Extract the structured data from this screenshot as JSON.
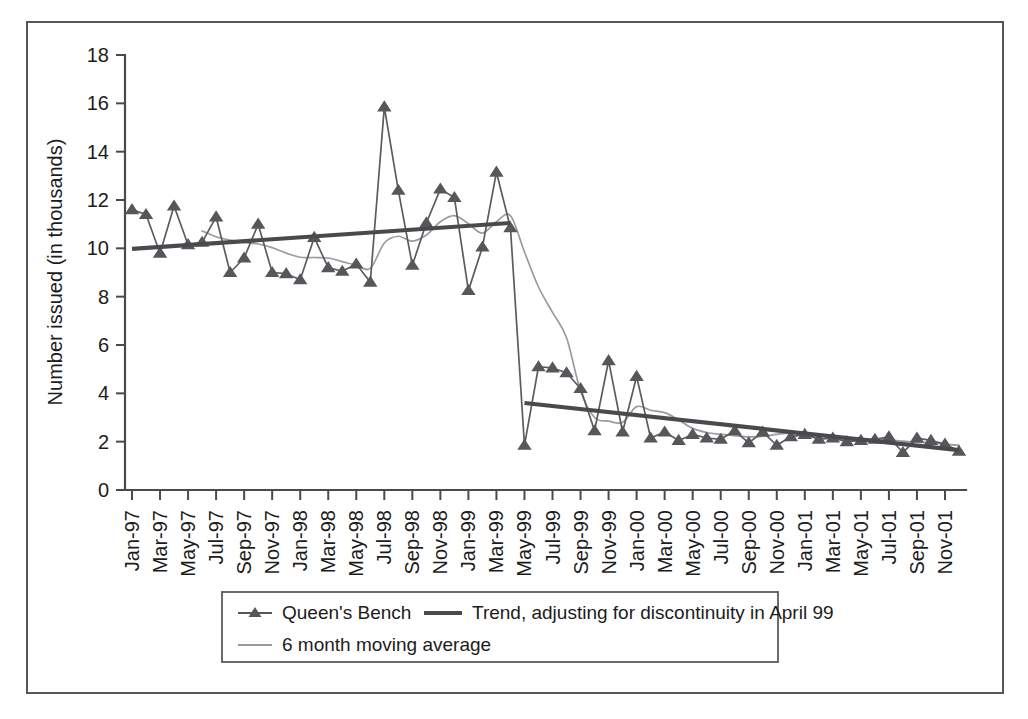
{
  "chart_data": {
    "type": "line",
    "title": "",
    "xlabel": "",
    "ylabel": "Number issued (in thousands)",
    "ylim": [
      0,
      18
    ],
    "ytick_step": 2,
    "yticks": [
      "0",
      "2",
      "4",
      "6",
      "8",
      "10",
      "12",
      "14",
      "16",
      "18"
    ],
    "grid": false,
    "legend_position": "below-plot",
    "x": [
      "Jan-97",
      "Feb-97",
      "Mar-97",
      "Apr-97",
      "May-97",
      "Jun-97",
      "Jul-97",
      "Aug-97",
      "Sep-97",
      "Oct-97",
      "Nov-97",
      "Dec-97",
      "Jan-98",
      "Feb-98",
      "Mar-98",
      "Apr-98",
      "May-98",
      "Jun-98",
      "Jul-98",
      "Aug-98",
      "Sep-98",
      "Oct-98",
      "Nov-98",
      "Dec-98",
      "Jan-99",
      "Feb-99",
      "Mar-99",
      "Apr-99",
      "May-99",
      "Jun-99",
      "Jul-99",
      "Aug-99",
      "Sep-99",
      "Oct-99",
      "Nov-99",
      "Dec-99",
      "Jan-00",
      "Feb-00",
      "Mar-00",
      "Apr-00",
      "May-00",
      "Jun-00",
      "Jul-00",
      "Aug-00",
      "Sep-00",
      "Oct-00",
      "Nov-00",
      "Dec-00",
      "Jan-01",
      "Feb-01",
      "Mar-01",
      "Apr-01",
      "May-01",
      "Jun-01",
      "Jul-01",
      "Aug-01",
      "Sep-01",
      "Oct-01",
      "Nov-01",
      "Dec-01"
    ],
    "xtick_labels": [
      "Jan-97",
      "Mar-97",
      "May-97",
      "Jul-97",
      "Sep-97",
      "Nov-97",
      "Jan-98",
      "Mar-98",
      "May-98",
      "Jul-98",
      "Sep-98",
      "Nov-98",
      "Jan-99",
      "Mar-99",
      "May-99",
      "Jul-99",
      "Sep-99",
      "Nov-99",
      "Jan-00",
      "Mar-00",
      "May-00",
      "Jul-00",
      "Sep-00",
      "Nov-00",
      "Jan-01",
      "Mar-01",
      "May-01",
      "Jul-01",
      "Sep-01",
      "Nov-01"
    ],
    "series": [
      {
        "name": "Queen's Bench",
        "marker": "triangle",
        "color": "#57575b",
        "values": [
          11.6,
          11.4,
          9.8,
          11.75,
          10.15,
          10.25,
          11.3,
          9.0,
          9.6,
          11.0,
          9.0,
          8.95,
          8.7,
          10.45,
          9.2,
          9.05,
          9.35,
          8.6,
          15.85,
          12.4,
          9.3,
          11.05,
          12.45,
          12.1,
          8.25,
          10.05,
          13.15,
          10.85,
          1.85,
          5.1,
          5.05,
          4.85,
          4.2,
          2.45,
          5.35,
          2.4,
          4.7,
          2.15,
          2.4,
          2.05,
          2.3,
          2.15,
          2.1,
          2.45,
          1.95,
          2.4,
          1.85,
          2.2,
          2.3,
          2.1,
          2.15,
          2.0,
          2.05,
          2.1,
          2.2,
          1.55,
          2.15,
          2.05,
          1.9,
          1.6
        ]
      },
      {
        "name": "6 month moving average",
        "marker": "none",
        "color": "#9b9b9f",
        "values": [
          null,
          null,
          null,
          null,
          null,
          10.72,
          10.48,
          10.34,
          10.24,
          10.18,
          10.03,
          9.8,
          9.63,
          9.62,
          9.6,
          9.45,
          9.3,
          9.17,
          10.22,
          10.5,
          10.3,
          10.55,
          11.1,
          11.35,
          11.02,
          10.63,
          11.1,
          11.35,
          9.85,
          8.4,
          7.35,
          6.3,
          4.1,
          3.0,
          2.85,
          2.8,
          3.45,
          3.3,
          3.2,
          2.9,
          2.55,
          2.38,
          2.3,
          2.25,
          2.2,
          2.22,
          2.3,
          2.35,
          2.22,
          2.25,
          2.2,
          2.15,
          2.12,
          2.1,
          2.08,
          2.02,
          1.98,
          1.95,
          1.9,
          1.85
        ]
      }
    ],
    "trend_segments": [
      {
        "name": "Trend, adjusting for discontinuity in April 99, pre-break",
        "x_start": "Jan-97",
        "x_end": "Apr-99",
        "y_start": 9.98,
        "y_end": 11.05
      },
      {
        "name": "Trend, adjusting for discontinuity in April 99, post-break",
        "x_start": "May-99",
        "x_end": "Dec-01",
        "y_start": 3.6,
        "y_end": 1.65
      }
    ],
    "annotations": [
      {
        "label": "discontinuity",
        "x": "April 99"
      }
    ],
    "legend": [
      {
        "label": "Queen's Bench",
        "style": "line-marker",
        "color": "#57575b"
      },
      {
        "label": "Trend, adjusting for discontinuity in April 99",
        "style": "thick-line",
        "color": "#4a4a4e"
      },
      {
        "label": "6 month moving average",
        "style": "thin-line",
        "color": "#9b9b9f"
      }
    ]
  },
  "colors": {
    "frame": "#56565a",
    "axis": "#4a4a4e",
    "series": "#57575b",
    "moving_average": "#9b9b9f",
    "trend": "#4a4a4e",
    "background": "#ffffff"
  }
}
